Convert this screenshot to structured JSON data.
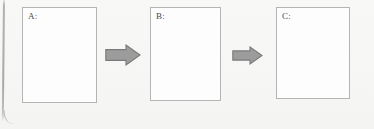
{
  "figure": {
    "type": "process-flow",
    "title": "",
    "background_color": "#f7f7f5",
    "orientation": "horizontal",
    "step_count": 3,
    "arrow_count": 2
  },
  "boxes": [
    {
      "id": "A",
      "label": "A:",
      "content": "",
      "x": 22,
      "y": 7,
      "width": 75,
      "height": 96,
      "fill": "#fdfdfd",
      "border_color": "#b4b4b4"
    },
    {
      "id": "B",
      "label": "B:",
      "content": "",
      "x": 150,
      "y": 7,
      "width": 71,
      "height": 94,
      "fill": "#fdfdfd",
      "border_color": "#b4b4b4"
    },
    {
      "id": "C",
      "label": "C:",
      "content": "",
      "x": 276,
      "y": 7,
      "width": 74,
      "height": 92,
      "fill": "#fdfdfd",
      "border_color": "#b4b4b4"
    }
  ],
  "arrows": [
    {
      "id": "arrow-a-to-b",
      "direction": "right",
      "from": "A",
      "to": "B",
      "x": 105,
      "y": 44,
      "width": 36,
      "height": 22,
      "fill": "#9c9c9c",
      "border_color": "#7a7a7a"
    },
    {
      "id": "arrow-b-to-c",
      "direction": "right",
      "from": "B",
      "to": "C",
      "x": 232,
      "y": 46,
      "width": 31,
      "height": 19,
      "fill": "#9c9c9c",
      "border_color": "#7a7a7a"
    }
  ],
  "artifacts": {
    "scan_edge_label": "page-edge-line"
  }
}
